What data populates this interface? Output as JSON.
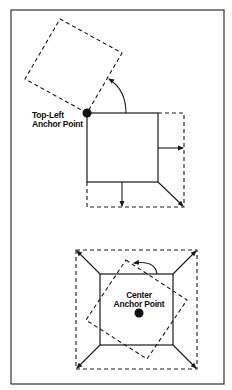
{
  "diagram": {
    "title": "",
    "colors": {
      "stroke": "#1a1a1a",
      "frame": "#333333",
      "background": "#ffffff"
    },
    "panels": [
      {
        "id": "top",
        "description": "Rotation and scaling about the top-left anchor point",
        "anchor_label_line1": "Top-Left",
        "anchor_label_line2": "Anchor Point",
        "shapes": {
          "original_square": "solid",
          "rotated_square": "dashed",
          "scaled_square": "dashed"
        },
        "arrows": [
          "rotation-arc",
          "scale-right",
          "scale-down",
          "scale-diagonal"
        ]
      },
      {
        "id": "bottom",
        "description": "Rotation and scaling about the center anchor point",
        "anchor_label_line1": "Center",
        "anchor_label_line2": "Anchor Point",
        "shapes": {
          "original_square": "solid",
          "rotated_square": "dashed",
          "scaled_square": "dashed"
        },
        "arrows": [
          "rotation-arc",
          "scale-top-left",
          "scale-top-right",
          "scale-bottom-left",
          "scale-bottom-right"
        ]
      }
    ]
  }
}
